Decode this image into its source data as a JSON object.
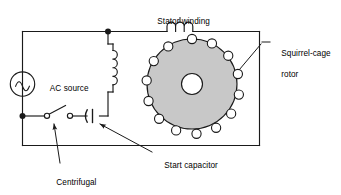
{
  "diagram": {
    "kind": "capacitor-start single-phase induction motor circuit",
    "background_color": "#ffffff",
    "line_color": "#1a1a1a",
    "rotor_fill_color": "#c8c8c8",
    "labels": {
      "stator_winding": "Stator winding",
      "squirrel_cage_rotor_line1": "Squirrel-cage",
      "squirrel_cage_rotor_line2": "rotor",
      "start_capacitor": "Start capacitor",
      "centrifugal_switch_line1": "Centrifugal",
      "centrifugal_switch_line2": "start switch",
      "ac_source": "AC source"
    },
    "components": {
      "ac_source_symbol": "sine-wave-in-circle",
      "stator_coil_loops": 3,
      "auxiliary_coil_loops": 4,
      "capacitor_type": "polarized-curved-plate",
      "switch_type": "single-pole-open-contacts",
      "rotor_bar_count": 14,
      "junction_dot_count": 2
    }
  }
}
